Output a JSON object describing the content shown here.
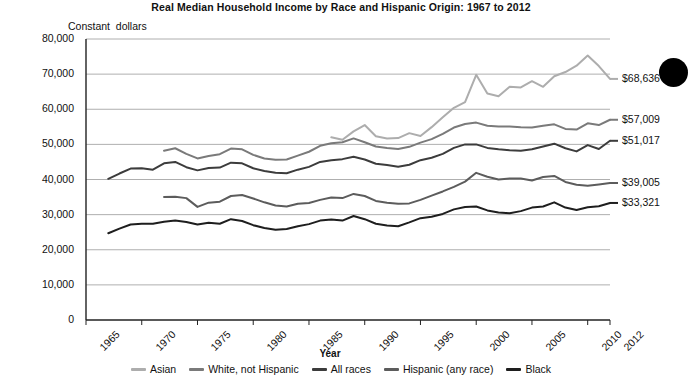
{
  "chart_data": {
    "type": "line",
    "title": "Real Median Household Income by Race and Hispanic Origin: 1967 to 2012",
    "subtitle": "Constant  dollars",
    "xlabel": "Year",
    "ylabel": "",
    "xlim": [
      1965,
      2012
    ],
    "ylim": [
      0,
      80000
    ],
    "grid": true,
    "legend_position": "bottom",
    "ytick_labels": [
      "80,000",
      "70,000",
      "60,000",
      "50,000",
      "40,000",
      "30,000",
      "20,000",
      "10,000",
      "0"
    ],
    "ytick_values": [
      80000,
      70000,
      60000,
      50000,
      40000,
      30000,
      20000,
      10000,
      0
    ],
    "xtick_labels": [
      "1965",
      "1970",
      "1975",
      "1980",
      "1985",
      "1990",
      "1995",
      "2000",
      "2005",
      "2010",
      "2012"
    ],
    "xtick_values": [
      1965,
      1970,
      1975,
      1980,
      1985,
      1990,
      1995,
      2000,
      2005,
      2010,
      2012
    ],
    "series": [
      {
        "name": "Asian",
        "color": "#adadad",
        "end_label": "$68,636",
        "end_value": 68636,
        "x": [
          1987,
          1988,
          1989,
          1990,
          1991,
          1992,
          1993,
          1994,
          1995,
          1996,
          1997,
          1998,
          1999,
          2000,
          2001,
          2002,
          2003,
          2004,
          2005,
          2006,
          2007,
          2008,
          2009,
          2010,
          2011,
          2012
        ],
        "values": [
          52000,
          51300,
          53700,
          55500,
          52300,
          51700,
          51800,
          53200,
          52400,
          54900,
          57700,
          60400,
          62000,
          69800,
          64500,
          63700,
          66400,
          66200,
          68000,
          66400,
          69400,
          70600,
          72400,
          75300,
          72300,
          68636
        ]
      },
      {
        "name": "White, not Hispanic",
        "color": "#7a7a7a",
        "end_label": "$57,009",
        "end_value": 57009,
        "x": [
          1972,
          1973,
          1974,
          1975,
          1976,
          1977,
          1978,
          1979,
          1980,
          1981,
          1982,
          1983,
          1984,
          1985,
          1986,
          1987,
          1988,
          1989,
          1990,
          1991,
          1992,
          1993,
          1994,
          1995,
          1996,
          1997,
          1998,
          1999,
          2000,
          2001,
          2002,
          2003,
          2004,
          2005,
          2006,
          2007,
          2008,
          2009,
          2010,
          2011,
          2012
        ],
        "values": [
          48200,
          48900,
          47300,
          46000,
          46700,
          47200,
          48800,
          48600,
          47000,
          46000,
          45600,
          45700,
          46800,
          47900,
          49600,
          50300,
          50600,
          51700,
          50600,
          49400,
          49000,
          48700,
          49300,
          50500,
          51500,
          53000,
          54800,
          55800,
          56200,
          55300,
          55100,
          55100,
          54900,
          54800,
          55300,
          55700,
          54400,
          54200,
          56000,
          55500,
          57009
        ]
      },
      {
        "name": "All races",
        "color": "#3c3c3c",
        "end_label": "$51,017",
        "end_value": 51017,
        "x": [
          1967,
          1968,
          1969,
          1970,
          1971,
          1972,
          1973,
          1974,
          1975,
          1976,
          1977,
          1978,
          1979,
          1980,
          1981,
          1982,
          1983,
          1984,
          1985,
          1986,
          1987,
          1988,
          1989,
          1990,
          1991,
          1992,
          1993,
          1994,
          1995,
          1996,
          1997,
          1998,
          1999,
          2000,
          2001,
          2002,
          2003,
          2004,
          2005,
          2006,
          2007,
          2008,
          2009,
          2010,
          2011,
          2012
        ],
        "values": [
          40200,
          41700,
          43100,
          43200,
          42800,
          44600,
          45000,
          43500,
          42600,
          43300,
          43400,
          44800,
          44600,
          43200,
          42400,
          41900,
          41800,
          42800,
          43600,
          45000,
          45500,
          45800,
          46500,
          45700,
          44500,
          44100,
          43600,
          44200,
          45500,
          46200,
          47300,
          49000,
          50000,
          50000,
          49000,
          48600,
          48300,
          48200,
          48600,
          49400,
          50200,
          48900,
          48000,
          49800,
          48700,
          51017
        ]
      },
      {
        "name": "Hispanic (any race)",
        "color": "#5c5c5c",
        "end_label": "$39,005",
        "end_value": 39005,
        "x": [
          1972,
          1973,
          1974,
          1975,
          1976,
          1977,
          1978,
          1979,
          1980,
          1981,
          1982,
          1983,
          1984,
          1985,
          1986,
          1987,
          1988,
          1989,
          1990,
          1991,
          1992,
          1993,
          1994,
          1995,
          1996,
          1997,
          1998,
          1999,
          2000,
          2001,
          2002,
          2003,
          2004,
          2005,
          2006,
          2007,
          2008,
          2009,
          2010,
          2011,
          2012
        ],
        "values": [
          35000,
          35100,
          34700,
          32200,
          33400,
          33700,
          35300,
          35600,
          34600,
          33500,
          32600,
          32300,
          33100,
          33300,
          34200,
          34900,
          34700,
          35900,
          35300,
          33900,
          33400,
          33100,
          33200,
          34200,
          35400,
          36600,
          37900,
          39400,
          41900,
          40800,
          40000,
          40300,
          40300,
          39700,
          40700,
          41000,
          39300,
          38500,
          38200,
          38600,
          39005
        ]
      },
      {
        "name": "Black",
        "color": "#1e1e1e",
        "end_label": "$33,321",
        "end_value": 33321,
        "x": [
          1967,
          1968,
          1969,
          1970,
          1971,
          1972,
          1973,
          1974,
          1975,
          1976,
          1977,
          1978,
          1979,
          1980,
          1981,
          1982,
          1983,
          1984,
          1985,
          1986,
          1987,
          1988,
          1989,
          1990,
          1991,
          1992,
          1993,
          1994,
          1995,
          1996,
          1997,
          1998,
          1999,
          2000,
          2001,
          2002,
          2003,
          2004,
          2005,
          2006,
          2007,
          2008,
          2009,
          2010,
          2011,
          2012
        ],
        "values": [
          24700,
          26000,
          27200,
          27400,
          27400,
          28000,
          28300,
          27900,
          27200,
          27700,
          27400,
          28700,
          28200,
          27000,
          26200,
          25700,
          25900,
          26700,
          27300,
          28300,
          28600,
          28300,
          29600,
          28700,
          27400,
          26900,
          26700,
          27800,
          29000,
          29400,
          30200,
          31500,
          32200,
          32300,
          31200,
          30600,
          30400,
          31000,
          32000,
          32300,
          33500,
          32000,
          31300,
          32100,
          32400,
          33321
        ]
      }
    ]
  },
  "legend": {
    "items": [
      {
        "label": "Asian",
        "color": "#adadad"
      },
      {
        "label": "White, not Hispanic",
        "color": "#7a7a7a"
      },
      {
        "label": "All races",
        "color": "#3c3c3c"
      },
      {
        "label": "Hispanic (any race)",
        "color": "#5c5c5c"
      },
      {
        "label": "Black",
        "color": "#1e1e1e"
      }
    ]
  },
  "artifacts": {
    "blob_color": "#000000"
  }
}
